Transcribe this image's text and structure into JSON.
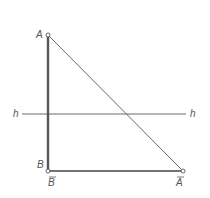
{
  "diagram": {
    "type": "geometric-construction",
    "points": {
      "A": {
        "label": "A",
        "x": 48,
        "y": 35
      },
      "B": {
        "label": "B",
        "x": 48,
        "y": 171
      },
      "B_bar": {
        "label": "B",
        "overbar": true,
        "x": 48,
        "y": 171
      },
      "A_bar": {
        "label": "A",
        "overbar": true,
        "x": 183,
        "y": 171
      }
    },
    "lines": {
      "h_left_label": "h",
      "h_right_label": "h",
      "h_y": 114
    },
    "colors": {
      "thick_line": "#555555",
      "thin_line": "#666666",
      "label": "#555555",
      "background": "#ffffff"
    }
  }
}
